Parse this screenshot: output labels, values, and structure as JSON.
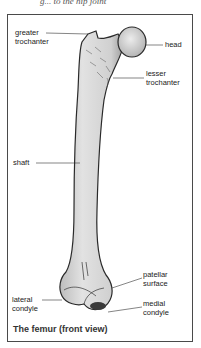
{
  "top_caption": "g... to the hip joint",
  "diagram": {
    "title": "The femur (front view)",
    "labels": {
      "greater_trochanter": [
        "greater",
        "trochanter"
      ],
      "head": "head",
      "lesser_trochanter": [
        "lesser",
        "trochanter"
      ],
      "shaft": "shaft",
      "patellar_surface": [
        "patellar",
        "surface"
      ],
      "lateral_condyle": [
        "lateral",
        "condyle"
      ],
      "medial_condyle": [
        "medial",
        "condyle"
      ]
    },
    "colors": {
      "bone_fill": "#d9d9d9",
      "bone_outline": "#2a2a2a",
      "frame": "#4a4a4a",
      "text": "#222222"
    }
  }
}
